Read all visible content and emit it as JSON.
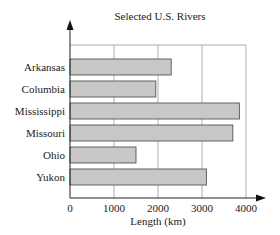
{
  "chart_data": {
    "type": "bar",
    "orientation": "horizontal",
    "title": "Selected U.S. Rivers",
    "xlabel": "Length (km)",
    "ylabel": "",
    "categories": [
      "Arkansas",
      "Columbia",
      "Mississippi",
      "Missouri",
      "Ohio",
      "Yukon"
    ],
    "values": [
      2300,
      1950,
      3850,
      3700,
      1500,
      3100
    ],
    "xlim": [
      0,
      4000
    ],
    "x_ticks": [
      "0",
      "1000",
      "2000",
      "3000",
      "4000"
    ],
    "grid": "vertical",
    "legend": "none",
    "bar_color": "#c8c8c8",
    "bar_edge_color": "#555555"
  }
}
